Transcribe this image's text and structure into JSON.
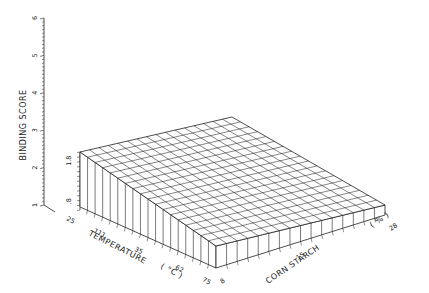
{
  "chart_data": {
    "type": "surface3d",
    "title": "",
    "zlabel": "BINDING SCORE",
    "xlabel": "TEMPERATURE (°C)",
    "ylabel": "CORN STARCH (%)",
    "z_axis_ticks": [
      "1",
      "2",
      "3",
      "4",
      "5",
      "6"
    ],
    "z_inner_ticks": [
      ".8",
      "1.8"
    ],
    "x_axis_ticks": [
      "25",
      "111",
      "35",
      "62",
      "75"
    ],
    "y_axis_ticks": [
      "8",
      "15",
      "28"
    ],
    "zlim": [
      1,
      6
    ],
    "grid_rows": 16,
    "grid_cols": 18,
    "surface_value_approx": 1.8,
    "grid": false,
    "legend": null
  },
  "labels": {
    "zlabel": "BINDING SCORE",
    "xlabel": "TEMPERATURE",
    "xunit": "( °C )",
    "ylabel": "CORN STARCH",
    "yunit": "( % )"
  },
  "colors": {
    "ink": "#222222",
    "background": "#ffffff",
    "face": "#ffffff"
  }
}
